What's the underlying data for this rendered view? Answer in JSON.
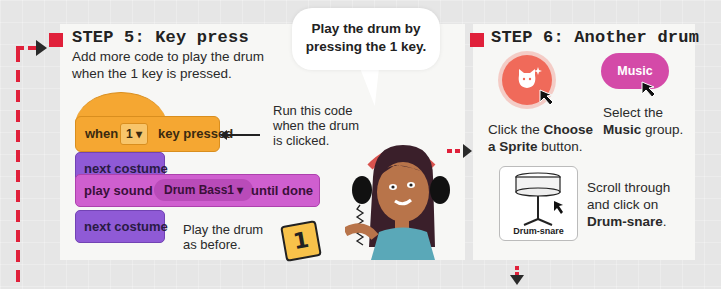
{
  "speech_bubble": {
    "line1": "Play the drum by",
    "line2": "pressing the 1 key."
  },
  "step5": {
    "title": "STEP 5: Key press",
    "intro_line1": "Add more code to play the drum",
    "intro_line2": "when the 1 key is pressed.",
    "blocks": {
      "hat_when": "when",
      "hat_key": "1",
      "hat_key_pressed": "key pressed",
      "next_costume_1": "next costume",
      "play_sound": "play sound",
      "sound_name": "Drum Bass1",
      "until_done": "until done",
      "next_costume_2": "next costume"
    },
    "callout_run": [
      "Run this code",
      "when the drum",
      "is clicked."
    ],
    "callout_play": [
      "Play the drum",
      "as before."
    ],
    "key_label": "1"
  },
  "step6": {
    "title": "STEP 6: Another drum",
    "choose_sprite_caption": {
      "pre": "Click the ",
      "bold1": "Choose",
      "bold2": "a Sprite",
      "post": " button."
    },
    "music_button": "Music",
    "music_caption": {
      "pre": "Select the",
      "bold": "Music",
      "post": " group."
    },
    "drum_card_label": "Drum-snare",
    "drum_caption": {
      "line1": "Scroll through",
      "line2": "and click on",
      "bold": "Drum-snare",
      "post": "."
    }
  },
  "colors": {
    "accent_red": "#e0203a",
    "event_orange": "#f5a732",
    "looks_purple": "#8f5ad6",
    "sound_pink": "#cf5fcf",
    "sprite_button": "#f06a5a",
    "music_pill": "#d44aa8"
  }
}
